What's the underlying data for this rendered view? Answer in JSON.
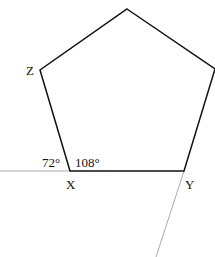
{
  "diagram": {
    "shape": "regular pentagon",
    "vertices": {
      "top": {
        "x": 127,
        "y": 9
      },
      "right": {
        "x": 215,
        "y": 69
      },
      "Y": {
        "x": 184,
        "y": 171
      },
      "X": {
        "x": 70,
        "y": 171
      },
      "Z": {
        "x": 40,
        "y": 70
      }
    },
    "labels": {
      "Z": "Z",
      "X": "X",
      "Y": "Y",
      "exterior_angle": "72°",
      "interior_angle": "108°"
    },
    "colors": {
      "pentagon": "#111111",
      "extension_lines": "#aaaaaa"
    }
  }
}
